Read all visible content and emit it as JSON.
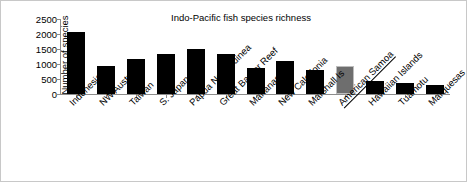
{
  "chart_data": {
    "type": "bar",
    "title": "Indo-Pacific fish species richness",
    "xlabel": "",
    "ylabel": "Number of species",
    "categories": [
      "Indonesia",
      "NW Australia",
      "Taiwan",
      "S. Japan",
      "Papua New Guinea",
      "Great Barrier Reef",
      "Marianas",
      "New Caledonia",
      "Marshall Is",
      "American Samoa",
      "Hawaiian Islands",
      "Tuamotu",
      "Marquesas"
    ],
    "values": [
      2060,
      950,
      1180,
      1320,
      1500,
      1320,
      860,
      1090,
      790,
      950,
      440,
      370,
      300
    ],
    "ylim": [
      0,
      2500
    ],
    "ytick_labels": [
      "0",
      "500",
      "1000",
      "1500",
      "2000",
      "2500"
    ],
    "ytick_values": [
      0,
      500,
      1000,
      1500,
      2000,
      2500
    ],
    "grid": false,
    "legend": "none",
    "highlight_category": "American Samoa",
    "bar_color": "#000000",
    "highlight_color": "#6e6e6e",
    "axis_color": "#8c8c8c",
    "underlined_categories": [
      "American Samoa"
    ]
  }
}
